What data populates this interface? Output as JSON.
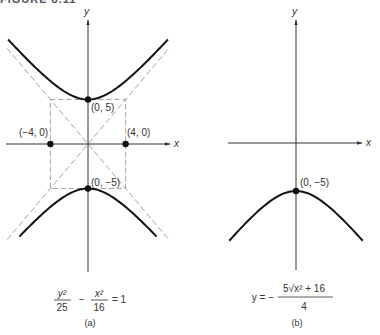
{
  "figure_title": "FIGURE 8.11",
  "panel_a": {
    "x_axis_label": "x",
    "y_axis_label": "y",
    "points": [
      {
        "label": "(0, 5)",
        "x": 0,
        "y": 5
      },
      {
        "label": "(0, −5)",
        "x": 0,
        "y": -5
      },
      {
        "label": "(−4, 0)",
        "x": -4,
        "y": 0
      },
      {
        "label": "(4, 0)",
        "x": 4,
        "y": 0
      }
    ],
    "equation": {
      "num1": "y²",
      "den1": "25",
      "minus": "−",
      "num2": "x²",
      "den2": "16",
      "rhs": "= 1"
    },
    "a": 4,
    "b": 5,
    "caption": "(a)"
  },
  "panel_b": {
    "x_axis_label": "x",
    "y_axis_label": "y",
    "points": [
      {
        "label": "(0, −5)",
        "x": 0,
        "y": -5
      }
    ],
    "equation": {
      "lhs": "y = −",
      "numerator": "5√x² + 16",
      "denominator": "4"
    },
    "caption": "(b)"
  }
}
